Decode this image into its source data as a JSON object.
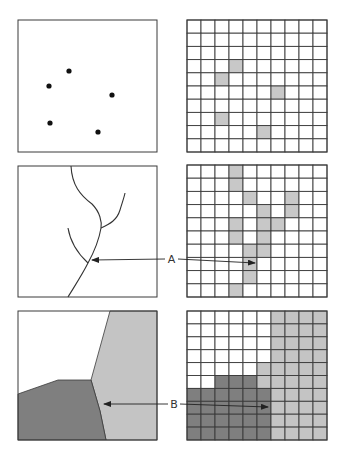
{
  "colors": {
    "stroke": "#3a3a3a",
    "cell_highlight": "#c8c8c8",
    "region_light": "#c4c4c4",
    "region_dark": "#7f7f7f",
    "background": "#ffffff",
    "point": "#111111"
  },
  "grid": {
    "columns": 10,
    "rows": 10
  },
  "rows": [
    {
      "name": "point-features",
      "vector_type": "points",
      "raster_cells": [
        [
          3,
          3
        ],
        [
          2,
          4
        ],
        [
          6,
          5
        ],
        [
          2,
          7
        ],
        [
          5,
          8
        ]
      ]
    },
    {
      "name": "line-features",
      "vector_type": "lines",
      "raster_cells": [
        [
          3,
          0
        ],
        [
          3,
          1
        ],
        [
          4,
          2
        ],
        [
          7,
          2
        ],
        [
          5,
          3
        ],
        [
          7,
          3
        ],
        [
          3,
          4
        ],
        [
          5,
          4
        ],
        [
          6,
          4
        ],
        [
          3,
          5
        ],
        [
          5,
          5
        ],
        [
          4,
          6
        ],
        [
          5,
          6
        ],
        [
          4,
          7
        ],
        [
          4,
          8
        ],
        [
          3,
          9
        ]
      ],
      "callout_label": "A"
    },
    {
      "name": "polygon-features",
      "vector_type": "polygons",
      "raster_rows": [
        "WWWWWWLLLL",
        "WWWWWWLLLL",
        "WWWWWWLLLL",
        "WWWWWWLLLL",
        "WWWWWLLLLL",
        "WWDDDLLLLL",
        "DDDDDDLLLL",
        "DDDDDDLLLL",
        "DDDDDDLLLL",
        "DDDDDDLLLL"
      ],
      "callout_label": "B"
    }
  ]
}
